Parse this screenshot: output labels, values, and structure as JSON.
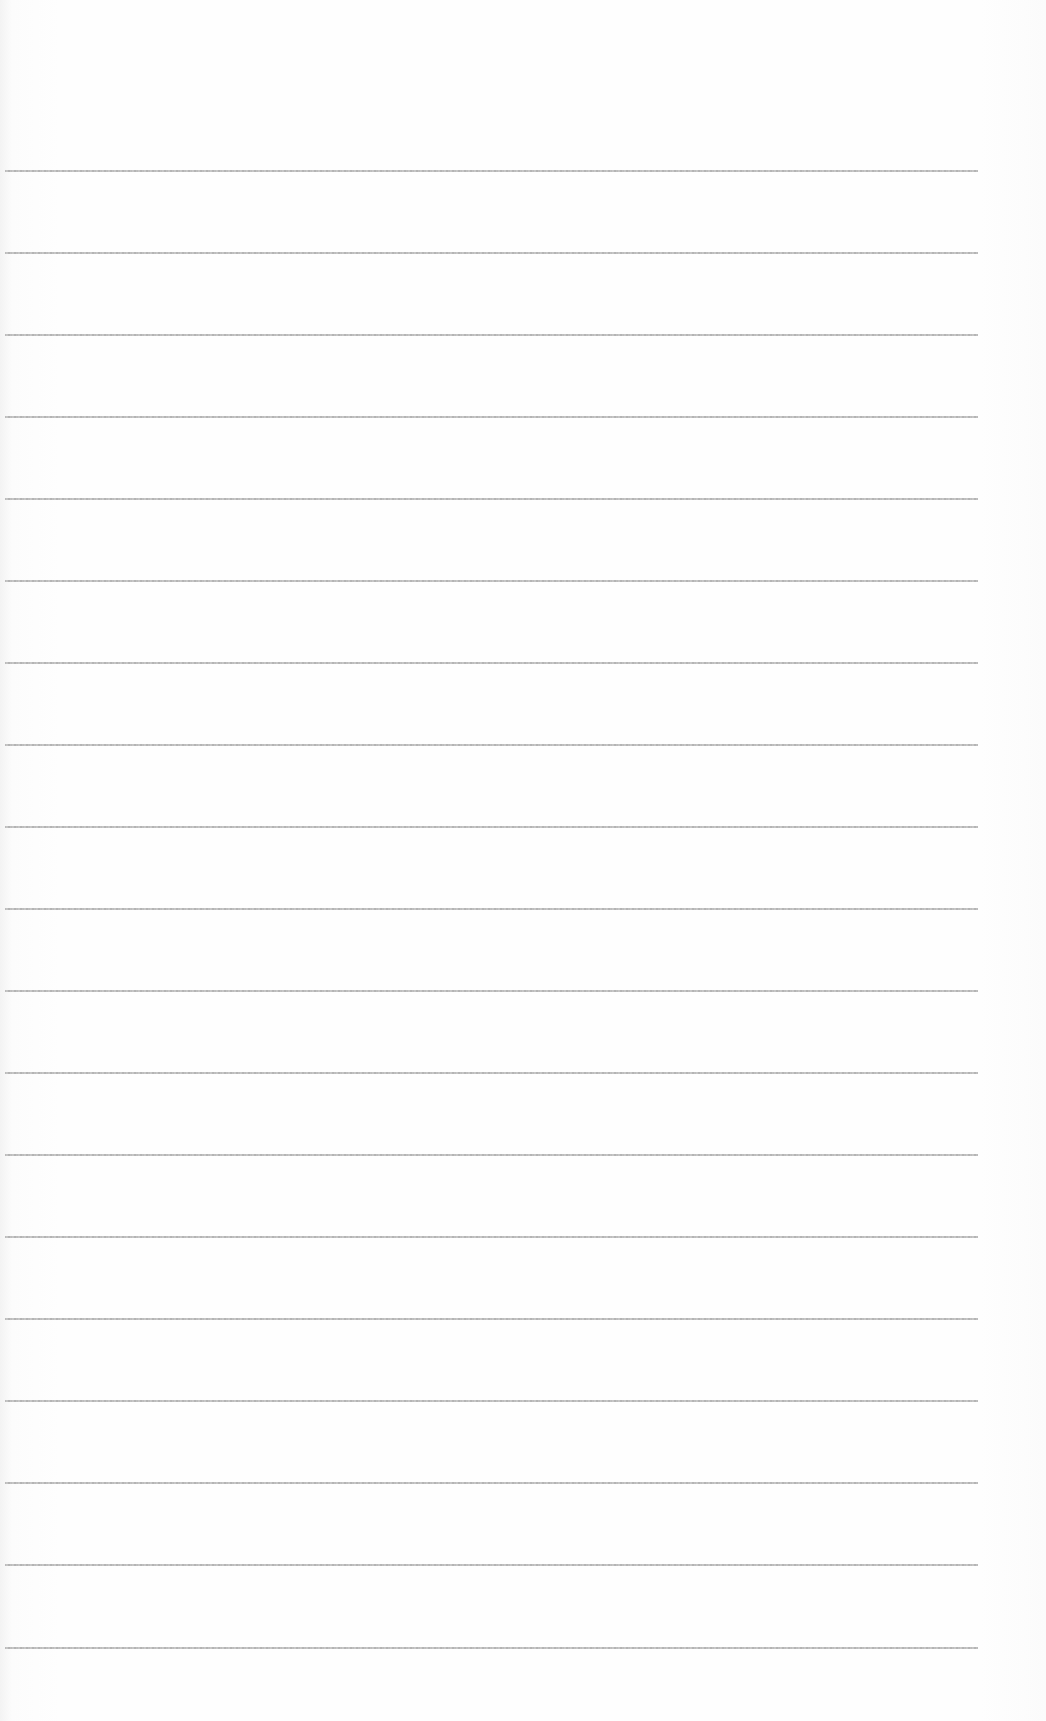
{
  "page": {
    "type": "lined paper",
    "background_color": "#fdfdfd",
    "rule_color": "#b0b0b0",
    "rules": [
      {
        "y": 170
      },
      {
        "y": 252
      },
      {
        "y": 334
      },
      {
        "y": 416
      },
      {
        "y": 498
      },
      {
        "y": 580
      },
      {
        "y": 662
      },
      {
        "y": 744
      },
      {
        "y": 826
      },
      {
        "y": 908
      },
      {
        "y": 990
      },
      {
        "y": 1072
      },
      {
        "y": 1154
      },
      {
        "y": 1236
      },
      {
        "y": 1318
      },
      {
        "y": 1400
      },
      {
        "y": 1482
      },
      {
        "y": 1564
      },
      {
        "y": 1647
      }
    ]
  }
}
